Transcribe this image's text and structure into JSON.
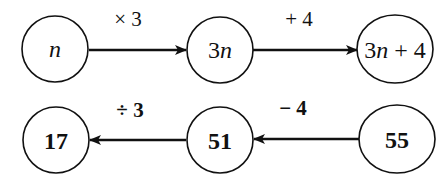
{
  "diagram": {
    "top_row": {
      "nodes": [
        {
          "id": "n",
          "label": "n"
        },
        {
          "id": "3n",
          "label_num": "3",
          "label_var": "n"
        },
        {
          "id": "3n+4",
          "label_num": "3",
          "label_var": "n",
          "label_rest": " + 4"
        }
      ],
      "edges": [
        {
          "from": "n",
          "to": "3n",
          "label": "× 3"
        },
        {
          "from": "3n",
          "to": "3n+4",
          "label": "+ 4"
        }
      ]
    },
    "bottom_row": {
      "nodes": [
        {
          "id": "17",
          "label": "17"
        },
        {
          "id": "51",
          "label": "51"
        },
        {
          "id": "55",
          "label": "55"
        }
      ],
      "edges": [
        {
          "from": "55",
          "to": "51",
          "label": "− 4"
        },
        {
          "from": "51",
          "to": "17",
          "label": "÷ 3"
        }
      ]
    }
  }
}
